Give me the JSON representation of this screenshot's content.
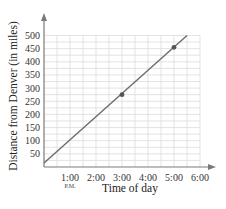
{
  "chart_data": {
    "type": "line",
    "title": "",
    "xlabel": "Time of day",
    "ylabel": "Distance from Denver (in miles)",
    "x_tick_labels": [
      "1:00",
      "2:00",
      "3:00",
      "4:00",
      "5:00",
      "6:00"
    ],
    "x_tick_sublabel": {
      "index": 0,
      "text": "P.M."
    },
    "y_tick_labels": [
      "50",
      "100",
      "150",
      "200",
      "250",
      "300",
      "350",
      "400",
      "450",
      "500"
    ],
    "xlim": [
      0,
      6
    ],
    "ylim": [
      0,
      500
    ],
    "grid": true,
    "series": [
      {
        "name": "Distance",
        "line": {
          "x": [
            0,
            5.5
          ],
          "y": [
            15,
            500
          ]
        },
        "points": [
          {
            "x": 3,
            "label": "3:00",
            "y": 275
          },
          {
            "x": 5,
            "label": "5:00",
            "y": 455
          }
        ]
      }
    ],
    "colors": {
      "line": "#6b6b6b",
      "grid": "#dcdcdc",
      "axis": "#7a7a7a",
      "point": "#555555"
    }
  }
}
